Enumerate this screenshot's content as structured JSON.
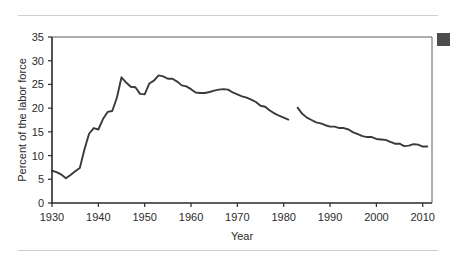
{
  "figure": {
    "rule_color": "#cfcfcf",
    "background": "#ffffff",
    "corner_marker_label": "corner-swatch",
    "corner_marker_color": "#4d4d4d"
  },
  "chart_data": {
    "type": "line",
    "title": "",
    "xlabel": "Year",
    "ylabel": "Percent of the labor force",
    "xlim": [
      1930,
      2012
    ],
    "ylim": [
      0,
      35
    ],
    "xticks": [
      1930,
      1940,
      1950,
      1960,
      1970,
      1980,
      1990,
      2000,
      2010
    ],
    "xticklabels": [
      "1930",
      "1940",
      "1950",
      "1960",
      "1970",
      "1980",
      "1990",
      "2000",
      "2010"
    ],
    "yticks": [
      0,
      5,
      10,
      15,
      20,
      25,
      30,
      35
    ],
    "yticklabels": [
      "0",
      "5",
      "10",
      "15",
      "20",
      "25",
      "30",
      "35"
    ],
    "grid": false,
    "legend": false,
    "line_color": "#3a3a3a",
    "series": [
      {
        "name": "Union membership, 1930-1981",
        "x": [
          1930,
          1931,
          1932,
          1933,
          1934,
          1935,
          1936,
          1937,
          1938,
          1939,
          1940,
          1941,
          1942,
          1943,
          1944,
          1945,
          1946,
          1947,
          1948,
          1949,
          1950,
          1951,
          1952,
          1953,
          1954,
          1955,
          1956,
          1957,
          1958,
          1959,
          1960,
          1961,
          1962,
          1963,
          1964,
          1965,
          1966,
          1967,
          1968,
          1969,
          1970,
          1971,
          1972,
          1973,
          1974,
          1975,
          1976,
          1977,
          1978,
          1979,
          1980,
          1981
        ],
        "values": [
          6.8,
          6.5,
          6.0,
          5.2,
          5.9,
          6.7,
          7.4,
          11.3,
          14.6,
          15.8,
          15.5,
          17.7,
          19.2,
          19.4,
          22.2,
          26.5,
          25.4,
          24.5,
          24.4,
          23.0,
          22.9,
          25.2,
          25.8,
          26.9,
          26.7,
          26.2,
          26.2,
          25.6,
          24.8,
          24.6,
          24.0,
          23.3,
          23.2,
          23.2,
          23.4,
          23.7,
          23.9,
          24.0,
          23.9,
          23.3,
          22.9,
          22.5,
          22.2,
          21.8,
          21.3,
          20.5,
          20.3,
          19.5,
          18.9,
          18.4,
          18.0,
          17.6
        ]
      },
      {
        "name": "Union membership, 1983-2011",
        "x": [
          1983,
          1984,
          1985,
          1986,
          1987,
          1988,
          1989,
          1990,
          1991,
          1992,
          1993,
          1994,
          1995,
          1996,
          1997,
          1998,
          1999,
          2000,
          2001,
          2002,
          2003,
          2004,
          2005,
          2006,
          2007,
          2008,
          2009,
          2010,
          2011
        ],
        "values": [
          20.1,
          18.8,
          18.0,
          17.5,
          17.0,
          16.8,
          16.4,
          16.1,
          16.1,
          15.8,
          15.8,
          15.5,
          14.9,
          14.5,
          14.1,
          13.9,
          13.9,
          13.5,
          13.4,
          13.3,
          12.9,
          12.5,
          12.5,
          12.0,
          12.1,
          12.4,
          12.3,
          11.9,
          11.9
        ]
      }
    ],
    "break_note": "Series discontinuity between 1981 and 1983"
  }
}
